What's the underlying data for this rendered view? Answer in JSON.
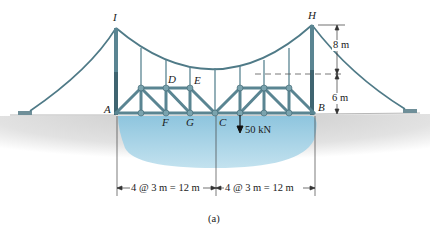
{
  "figure": {
    "caption": "(a)",
    "colors": {
      "steel": "#5a8592",
      "steel_dark": "#3f6470",
      "water": "#a9d3e6",
      "ground": "#d6d6d6",
      "ink": "#1a1a1a"
    }
  },
  "joints": {
    "I": "I",
    "H": "H",
    "A": "A",
    "B": "B",
    "C": "C",
    "D": "D",
    "E": "E",
    "F": "F",
    "G": "G"
  },
  "load": {
    "label": "50 kN"
  },
  "dimensions": {
    "tower_upper": "8 m",
    "tower_lower": "6 m",
    "span_left": "4 @ 3 m = 12 m",
    "span_right": "4 @ 3 m = 12 m"
  }
}
